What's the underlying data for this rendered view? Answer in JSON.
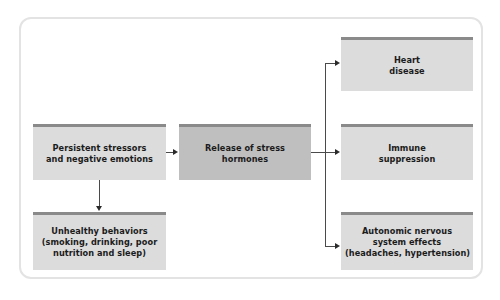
{
  "diagram": {
    "colors": {
      "frame_border": "#e3e3e3",
      "node_fill": "#dcdcdc",
      "node_fill_emphasis": "#bfbfbf",
      "node_top_strip": "#8a8a8a",
      "connector": "#4a4a4a",
      "arrowhead": "#2b2b2b",
      "text": "#1b1b1b",
      "background": "#ffffff"
    },
    "nodes": [
      {
        "id": "stressors",
        "lines": [
          "Persistent stressors",
          "and negative emotions"
        ],
        "emphasis": false
      },
      {
        "id": "hormones",
        "lines": [
          "Release of stress",
          "hormones"
        ],
        "emphasis": true
      },
      {
        "id": "behaviors",
        "lines": [
          "Unhealthy behaviors",
          "(smoking, drinking, poor",
          "nutrition and sleep)"
        ],
        "emphasis": false
      },
      {
        "id": "heart",
        "lines": [
          "Heart",
          "disease"
        ],
        "emphasis": false
      },
      {
        "id": "immune",
        "lines": [
          "Immune",
          "suppression"
        ],
        "emphasis": false
      },
      {
        "id": "autonomic",
        "lines": [
          "Autonomic nervous",
          "system effects",
          "(headaches, hypertension)"
        ],
        "emphasis": false
      }
    ],
    "edges": [
      {
        "from": "stressors",
        "to": "hormones",
        "direction": "right"
      },
      {
        "from": "stressors",
        "to": "behaviors",
        "direction": "down"
      },
      {
        "from": "hormones",
        "to": "heart",
        "direction": "right"
      },
      {
        "from": "hormones",
        "to": "immune",
        "direction": "right"
      },
      {
        "from": "hormones",
        "to": "autonomic",
        "direction": "right"
      }
    ]
  }
}
